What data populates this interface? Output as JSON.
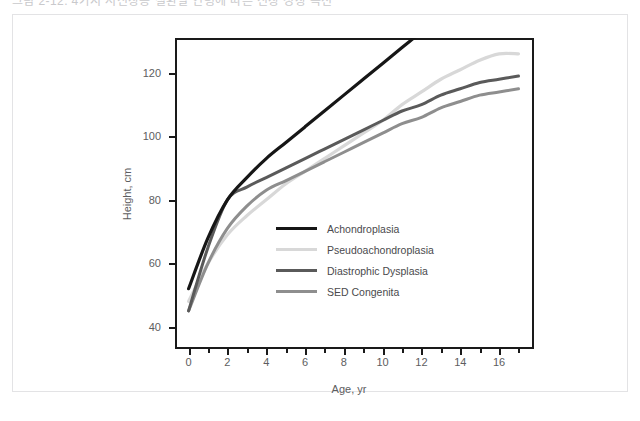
{
  "top_strip": {
    "clipped_text": "그림 2-12. 4가지 저신장증 질환별 연령에 따른 신장 성장 곡선"
  },
  "chart_data": {
    "type": "line",
    "title": "",
    "xlabel": "Age, yr",
    "ylabel": "Height, cm",
    "xlim": [
      -0.7,
      17.8
    ],
    "ylim": [
      33,
      131
    ],
    "grid": false,
    "legend_position": "inside-center-left",
    "xticks": [
      0,
      2,
      4,
      6,
      8,
      10,
      12,
      14,
      16
    ],
    "xticklabels": [
      "0",
      "2",
      "4",
      "6",
      "8",
      "10",
      "12",
      "14",
      "16"
    ],
    "yticks": [
      40,
      60,
      80,
      100,
      120
    ],
    "yticklabels": [
      "40",
      "60",
      "80",
      "100",
      "120"
    ],
    "x": [
      0,
      1,
      2,
      3,
      4,
      5,
      6,
      7,
      8,
      9,
      10,
      11,
      12,
      13,
      14,
      15,
      16,
      17
    ],
    "series": [
      {
        "name": "Achondroplasia",
        "color": "#161616",
        "width": 3.2,
        "values": [
          52,
          68,
          80,
          87,
          93,
          98,
          103,
          108,
          113,
          118,
          123,
          128,
          133,
          null,
          null,
          null,
          null,
          null
        ]
      },
      {
        "name": "Pseudoachondroplasia",
        "color": "#d8d8d8",
        "width": 3.2,
        "values": [
          48,
          60,
          69,
          75,
          80,
          85,
          89,
          93,
          97,
          101,
          105,
          110,
          114,
          118,
          121,
          124,
          126,
          126
        ]
      },
      {
        "name": "Diastrophic Dysplasia",
        "color": "#5a5a5a",
        "width": 3.0,
        "values": [
          45,
          65,
          80,
          84,
          87,
          90,
          93,
          96,
          99,
          102,
          105,
          108,
          110,
          113,
          115,
          117,
          118,
          119
        ]
      },
      {
        "name": "SED Congenita",
        "color": "#8e8e8e",
        "width": 3.0,
        "values": [
          45,
          60,
          71,
          78,
          83,
          86,
          89,
          92,
          95,
          98,
          101,
          104,
          106,
          109,
          111,
          113,
          114,
          115
        ]
      }
    ]
  }
}
